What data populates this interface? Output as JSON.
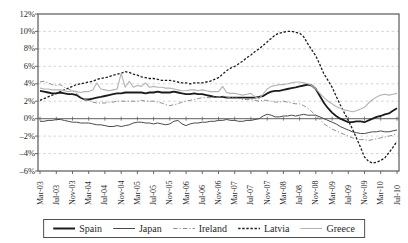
{
  "chart_data": {
    "type": "line",
    "title": "",
    "xlabel": "",
    "ylabel": "",
    "x_frequency": "monthly",
    "x_start": "Mar-03",
    "x_end": "Jul-10",
    "ylim": [
      -6,
      12
    ],
    "y_tick_step": 2,
    "grid": "horizontal-dashed",
    "zero_axis_with_ticks": true,
    "legend_position": "bottom-boxed",
    "colors": {
      "frame": "#595959",
      "gridline": "#c9c9c9",
      "zero_axis": "#606060",
      "label_text": "#2b2b2b"
    },
    "y_tick_labels": [
      "12%",
      "10%",
      "8%",
      "6%",
      "4%",
      "2%",
      "0%",
      "–2%",
      "–4%",
      "–6%"
    ],
    "x_tick_labels": [
      "Mar-03",
      "Jul-03",
      "Nov-03",
      "Mar-04",
      "Jul-04",
      "Nov-04",
      "Mar-05",
      "Jul-05",
      "Nov-05",
      "Mar-06",
      "Jul-06",
      "Nov-06",
      "Mar-07",
      "Jul-07",
      "Nov-07",
      "Mar-08",
      "Jul-08",
      "Nov-08",
      "Mar-09",
      "Jul-09",
      "Nov-09",
      "Mar-10",
      "Jul-10"
    ],
    "series": [
      {
        "name": "Spain",
        "style": "solid-thick",
        "color": "#1c1c1c",
        "values": [
          3.2,
          3.1,
          3.0,
          2.9,
          2.9,
          3.0,
          2.9,
          2.8,
          2.8,
          2.7,
          2.4,
          2.2,
          2.2,
          2.3,
          2.4,
          2.5,
          2.6,
          2.7,
          2.8,
          2.9,
          2.9,
          3.0,
          3.0,
          3.0,
          3.0,
          3.0,
          2.9,
          3.0,
          3.0,
          3.1,
          3.0,
          3.0,
          3.0,
          3.1,
          3.0,
          2.9,
          2.8,
          2.8,
          2.9,
          2.8,
          2.8,
          2.7,
          2.6,
          2.5,
          2.5,
          2.5,
          2.4,
          2.4,
          2.4,
          2.4,
          2.4,
          2.4,
          2.4,
          2.4,
          2.5,
          2.6,
          2.9,
          3.1,
          3.2,
          3.2,
          3.3,
          3.4,
          3.5,
          3.6,
          3.7,
          3.8,
          3.9,
          3.8,
          3.4,
          2.6,
          1.8,
          1.2,
          0.7,
          0.3,
          0.0,
          -0.2,
          -0.4,
          -0.4,
          -0.3,
          -0.3,
          -0.4,
          -0.2,
          0.0,
          0.2,
          0.3,
          0.5,
          0.6,
          0.9,
          1.2
        ]
      },
      {
        "name": "Japan",
        "style": "solid",
        "color": "#4a4a4a",
        "values": [
          -0.3,
          -0.3,
          -0.2,
          -0.2,
          -0.1,
          -0.1,
          -0.2,
          -0.3,
          -0.4,
          -0.4,
          -0.5,
          -0.5,
          -0.5,
          -0.6,
          -0.7,
          -0.7,
          -0.8,
          -0.9,
          -0.9,
          -0.8,
          -0.9,
          -0.8,
          -0.7,
          -0.5,
          -0.4,
          -0.4,
          -0.5,
          -0.5,
          -0.6,
          -0.5,
          -0.6,
          -0.7,
          -0.6,
          -0.3,
          -0.2,
          -0.6,
          -0.8,
          -0.6,
          -0.5,
          -0.5,
          -0.4,
          -0.4,
          -0.3,
          -0.3,
          -0.2,
          -0.2,
          -0.1,
          -0.2,
          -0.2,
          -0.3,
          -0.3,
          -0.2,
          -0.2,
          -0.1,
          0.0,
          0.3,
          0.5,
          0.4,
          0.2,
          0.2,
          0.3,
          0.3,
          0.4,
          0.3,
          0.4,
          0.5,
          0.4,
          0.4,
          0.4,
          0.2,
          0.0,
          -0.2,
          -0.4,
          -0.6,
          -0.9,
          -1.1,
          -1.3,
          -1.5,
          -1.6,
          -1.7,
          -1.7,
          -1.6,
          -1.5,
          -1.5,
          -1.4,
          -1.5,
          -1.5,
          -1.4,
          -1.3
        ]
      },
      {
        "name": "Ireland",
        "style": "dash-dot",
        "color": "#8f8f8f",
        "values": [
          4.2,
          4.3,
          4.1,
          3.9,
          3.8,
          3.9,
          3.6,
          3.4,
          3.2,
          2.9,
          2.5,
          2.2,
          2.1,
          1.9,
          1.8,
          1.8,
          1.8,
          1.9,
          1.9,
          2.0,
          2.0,
          2.0,
          2.0,
          2.0,
          2.0,
          2.1,
          2.0,
          2.0,
          2.0,
          1.9,
          1.8,
          1.6,
          1.5,
          1.6,
          1.7,
          1.9,
          2.0,
          2.1,
          2.2,
          2.3,
          2.4,
          2.4,
          2.4,
          2.5,
          2.5,
          2.6,
          2.5,
          2.4,
          2.4,
          2.3,
          2.2,
          2.2,
          2.2,
          2.1,
          2.0,
          2.1,
          2.1,
          2.0,
          1.9,
          1.9,
          2.0,
          1.9,
          1.8,
          1.7,
          1.7,
          1.5,
          1.2,
          0.8,
          0.4,
          -0.1,
          -0.6,
          -0.9,
          -1.2,
          -1.4,
          -1.6,
          -1.8,
          -2.0,
          -2.2,
          -2.3,
          -2.4,
          -2.4,
          -2.5,
          -2.4,
          -2.3,
          -2.2,
          -2.1,
          -2.0,
          -1.9,
          -1.7
        ]
      },
      {
        "name": "Latvia",
        "style": "dashed",
        "color": "#1c1c1c",
        "values": [
          2.1,
          2.3,
          2.5,
          2.7,
          2.9,
          3.1,
          3.3,
          3.5,
          3.7,
          3.9,
          4.0,
          4.1,
          4.2,
          4.3,
          4.5,
          4.6,
          4.7,
          4.8,
          5.0,
          5.1,
          5.2,
          5.4,
          5.3,
          5.1,
          5.0,
          4.8,
          4.7,
          4.6,
          4.6,
          4.5,
          4.4,
          4.4,
          4.4,
          4.3,
          4.2,
          4.1,
          4.1,
          4.0,
          4.1,
          4.1,
          4.1,
          4.2,
          4.3,
          4.5,
          4.7,
          5.1,
          5.5,
          5.8,
          6.0,
          6.3,
          6.6,
          7.0,
          7.3,
          7.7,
          8.0,
          8.4,
          8.8,
          9.2,
          9.6,
          9.8,
          9.9,
          10.0,
          10.0,
          9.9,
          9.8,
          9.4,
          8.6,
          7.9,
          7.2,
          6.2,
          5.1,
          4.4,
          3.6,
          2.6,
          1.6,
          0.7,
          -0.2,
          -1.2,
          -2.2,
          -3.3,
          -4.4,
          -4.9,
          -5.1,
          -5.0,
          -4.8,
          -4.5,
          -3.9,
          -3.3,
          -2.6
        ]
      },
      {
        "name": "Greece",
        "style": "solid-light",
        "color": "#b3b3b3",
        "values": [
          3.5,
          3.4,
          3.4,
          3.3,
          3.3,
          3.3,
          3.2,
          3.1,
          3.2,
          3.1,
          3.0,
          3.1,
          3.1,
          3.3,
          4.1,
          3.4,
          3.3,
          3.2,
          3.3,
          3.4,
          5.2,
          3.6,
          4.3,
          3.6,
          3.8,
          3.7,
          4.1,
          3.6,
          3.7,
          3.6,
          3.6,
          3.5,
          3.5,
          3.4,
          3.3,
          3.2,
          3.2,
          3.3,
          3.3,
          3.2,
          3.3,
          3.2,
          3.1,
          3.1,
          3.1,
          3.7,
          3.0,
          2.9,
          2.9,
          2.8,
          2.7,
          2.8,
          2.9,
          2.5,
          2.3,
          2.8,
          3.4,
          3.7,
          3.8,
          3.9,
          3.9,
          4.0,
          4.1,
          4.2,
          4.2,
          4.1,
          4.0,
          3.8,
          3.4,
          2.9,
          2.4,
          2.0,
          1.7,
          1.4,
          1.2,
          1.0,
          0.9,
          0.8,
          0.9,
          1.1,
          1.3,
          1.8,
          2.2,
          2.5,
          2.7,
          2.8,
          2.7,
          2.8,
          2.9
        ]
      }
    ]
  }
}
